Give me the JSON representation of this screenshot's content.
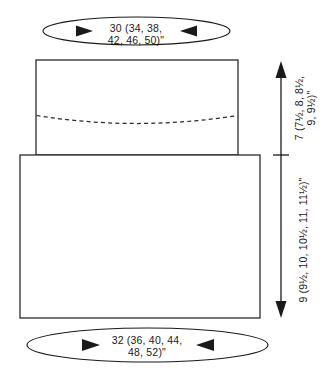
{
  "diagram": {
    "units": "inches",
    "line_color": "#2b2b2b",
    "text_color": "#1a1a1a",
    "background_color": "#ffffff"
  },
  "measurements": {
    "top_width": {
      "label_line_1": "30 (34, 38,",
      "label_line_2": "42, 46, 50)\"",
      "base": "30",
      "alternates": "34, 38, 42, 46, 50",
      "position": "top"
    },
    "bottom_width": {
      "label_line_1": "32 (36, 40, 44,",
      "label_line_2": "48, 52)\"",
      "base": "32",
      "alternates": "36, 40, 44, 48, 52",
      "position": "bottom"
    },
    "upper_height": {
      "label_line_1": "7 (7½, 8, 8½,",
      "label_line_2": "9, 9½)\"",
      "base": "7",
      "alternates": "7½, 8, 8½, 9, 9½",
      "position": "right-upper"
    },
    "lower_height": {
      "label_line_1": "9 (9½, 10, 10½, 11, 11½)\"",
      "base": "9",
      "alternates": "9½, 10, 10½, 11, 11½",
      "position": "right-lower"
    }
  },
  "shapes": {
    "upper_panel_name": "upper-body-panel",
    "lower_panel_name": "lower-body-panel",
    "dashed_curve_name": "armhole-guide-curve"
  }
}
